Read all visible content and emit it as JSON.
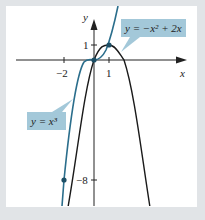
{
  "figure": {
    "axes": {
      "x_label": "x",
      "y_label": "y"
    },
    "ticks": {
      "x": [
        {
          "value": -2,
          "label": "−2"
        },
        {
          "value": 1,
          "label": "1"
        }
      ],
      "y": [
        {
          "value": 1,
          "label": "1"
        },
        {
          "value": -8,
          "label": "−8"
        }
      ]
    },
    "curves": [
      {
        "name": "parabola",
        "equation": "y = −x² + 2x",
        "color": "#1a1a1a"
      },
      {
        "name": "cubic",
        "equation": "y = x³",
        "color": "#2b6e8c"
      }
    ],
    "labels": {
      "parabola": "y = −x² + 2x",
      "cubic": "y = x³"
    },
    "intersection_points": [
      {
        "x": -2,
        "y": -8
      },
      {
        "x": 0,
        "y": 0
      },
      {
        "x": 1,
        "y": 1
      }
    ],
    "colors": {
      "frame": "#e1e4e7",
      "label_box": "#a3c8d9",
      "cubic": "#2b6e8c",
      "parabola": "#1a1a1a"
    }
  }
}
